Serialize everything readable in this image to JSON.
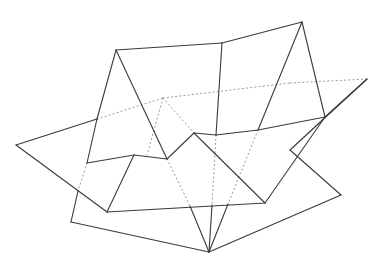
{
  "figure": {
    "title": "",
    "colors": {
      "solid_line": "#3a3a3a",
      "dotted_line": "#9a9a9a",
      "background": "#ffffff"
    },
    "solid_segments": [
      [
        116,
        50,
        222,
        43
      ],
      [
        222,
        43,
        302,
        22
      ],
      [
        116,
        50,
        97,
        119
      ],
      [
        97,
        119,
        16,
        145
      ],
      [
        16,
        145,
        107,
        212
      ],
      [
        97,
        119,
        87,
        163
      ],
      [
        87,
        163,
        134,
        155
      ],
      [
        116,
        50,
        167,
        159
      ],
      [
        134,
        155,
        167,
        159
      ],
      [
        167,
        159,
        194,
        133
      ],
      [
        194,
        133,
        216,
        135
      ],
      [
        216,
        135,
        258,
        130
      ],
      [
        222,
        43,
        216,
        135
      ],
      [
        302,
        22,
        258,
        130
      ],
      [
        258,
        130,
        325,
        117
      ],
      [
        302,
        22,
        325,
        117
      ],
      [
        325,
        117,
        367,
        79
      ],
      [
        367,
        79,
        290,
        150
      ],
      [
        290,
        150,
        341,
        195
      ],
      [
        341,
        195,
        209,
        252
      ],
      [
        194,
        133,
        265,
        203
      ],
      [
        265,
        203,
        325,
        117
      ],
      [
        134,
        155,
        107,
        212
      ],
      [
        107,
        212,
        265,
        203
      ],
      [
        78,
        191,
        71,
        222
      ],
      [
        71,
        222,
        209,
        252
      ],
      [
        190,
        206,
        209,
        252
      ],
      [
        212,
        205,
        209,
        252
      ],
      [
        228,
        204,
        209,
        252
      ]
    ],
    "dotted_segments": [
      [
        97,
        119,
        163,
        98
      ],
      [
        163,
        98,
        290,
        83
      ],
      [
        290,
        83,
        367,
        79
      ],
      [
        163,
        98,
        147,
        155
      ],
      [
        163,
        98,
        194,
        133
      ],
      [
        87,
        163,
        78,
        191
      ],
      [
        167,
        159,
        190,
        206
      ],
      [
        216,
        135,
        212,
        205
      ],
      [
        258,
        130,
        228,
        204
      ],
      [
        325,
        117,
        290,
        150
      ]
    ]
  }
}
